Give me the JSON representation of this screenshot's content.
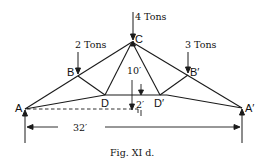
{
  "figure": {
    "caption": "Fig. XI d.",
    "nodes": {
      "A": "A",
      "A_prime": "A′",
      "B": "B",
      "B_prime": "B′",
      "C": "C",
      "D": "D",
      "D_prime": "D′"
    },
    "loads": {
      "C": "4 Tons",
      "B": "2 Tons",
      "B_prime": "3 Tons"
    },
    "dimensions": {
      "span": "32′",
      "rise": "10′",
      "camber": "2′"
    }
  }
}
